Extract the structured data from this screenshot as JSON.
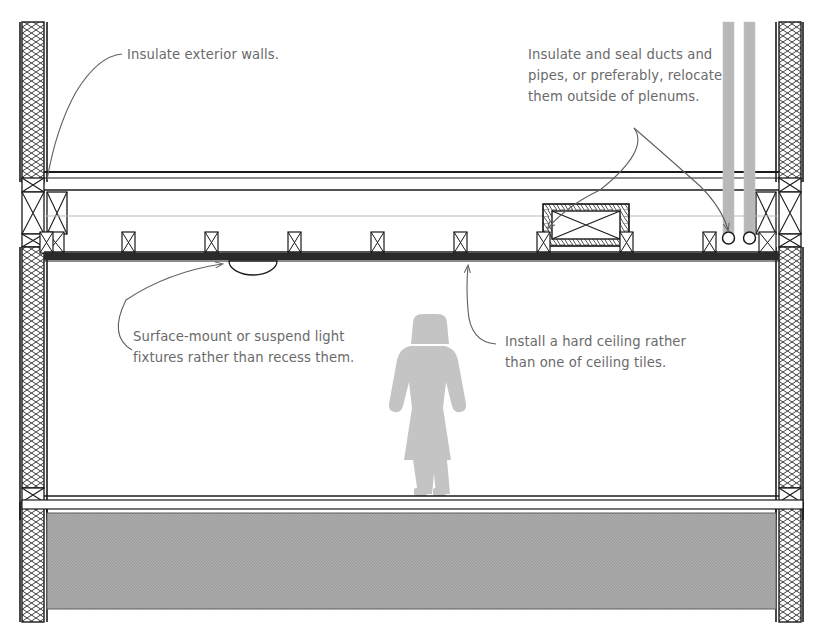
{
  "diagram": {
    "type": "architectural-building-section",
    "background_color": "#ffffff",
    "line_color": "#1a1a1a",
    "text_color": "#6a6a6a",
    "fill_gray": "#aaaaaa",
    "pipe_gray": "#b4b4b4"
  },
  "annotations": [
    {
      "id": "walls",
      "text": "Insulate exterior walls.",
      "target": "exterior-wall-left",
      "leader": "curved"
    },
    {
      "id": "ducts",
      "text": "Insulate and seal ducts and\npipes, or preferably, relocate\nthem outside of plenums.",
      "target": "duct-and-pipes",
      "leader": "curved-double-arrow"
    },
    {
      "id": "light",
      "text": "Surface-mount or suspend light\nfixtures rather than recess them.",
      "target": "light-fixture",
      "leader": "curved-arrow"
    },
    {
      "id": "ceiling",
      "text": "Install a hard ceiling rather\nthan one of ceiling tiles.",
      "target": "ceiling-assembly",
      "leader": "curved-arrow"
    }
  ],
  "components": {
    "wall_left": "insulated-exterior-wall-left",
    "wall_right": "insulated-exterior-wall-right",
    "roof_deck": "roof-deck",
    "plenum": "ceiling-plenum-cavity",
    "ceiling": "hard-ceiling-assembly",
    "joist_count": 9,
    "duct": "insulated-rectangular-duct",
    "pipes": "vertical-pipe-risers",
    "pipe_count": 2,
    "light_fixture": "surface-mount-dome-light",
    "occupant": "human-figure-scale-reference",
    "lower_floor": "lower-floor-slab"
  }
}
